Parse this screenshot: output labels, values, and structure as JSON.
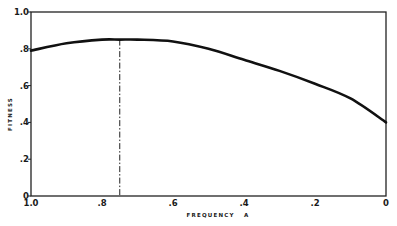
{
  "chart_data": {
    "type": "line",
    "title": "",
    "xlabel": "FREQUENCY   A",
    "ylabel": "FITNESS",
    "xlim": [
      1.0,
      0.0
    ],
    "ylim": [
      0,
      1.0
    ],
    "x_reversed": true,
    "grid": false,
    "legend": null,
    "x_ticks": [
      1.0,
      0.8,
      0.6,
      0.4,
      0.2,
      0
    ],
    "x_tick_labels": [
      "1.0",
      ".8",
      ".6",
      ".4",
      ".2",
      "0"
    ],
    "y_ticks": [
      0,
      0.2,
      0.4,
      0.6,
      0.8,
      1.0
    ],
    "y_tick_labels": [
      "0",
      ".2",
      ".4",
      ".6",
      ".8",
      "1.0"
    ],
    "series": [
      {
        "name": "fitness",
        "x": [
          1.0,
          0.9,
          0.8,
          0.75,
          0.7,
          0.6,
          0.5,
          0.4,
          0.3,
          0.2,
          0.1,
          0.0
        ],
        "values": [
          0.79,
          0.83,
          0.85,
          0.85,
          0.85,
          0.84,
          0.8,
          0.74,
          0.68,
          0.61,
          0.53,
          0.4
        ]
      }
    ],
    "annotations": [
      {
        "type": "vertical-dash-dot-line",
        "x": 0.75,
        "from_y": 0,
        "to_y": 0.85,
        "label": ""
      }
    ]
  },
  "plot_box": {
    "left": 31,
    "right": 386,
    "top": 12,
    "bottom": 196
  },
  "colors": {
    "line": "#111111",
    "frame": "#222222",
    "background": "#ffffff"
  }
}
